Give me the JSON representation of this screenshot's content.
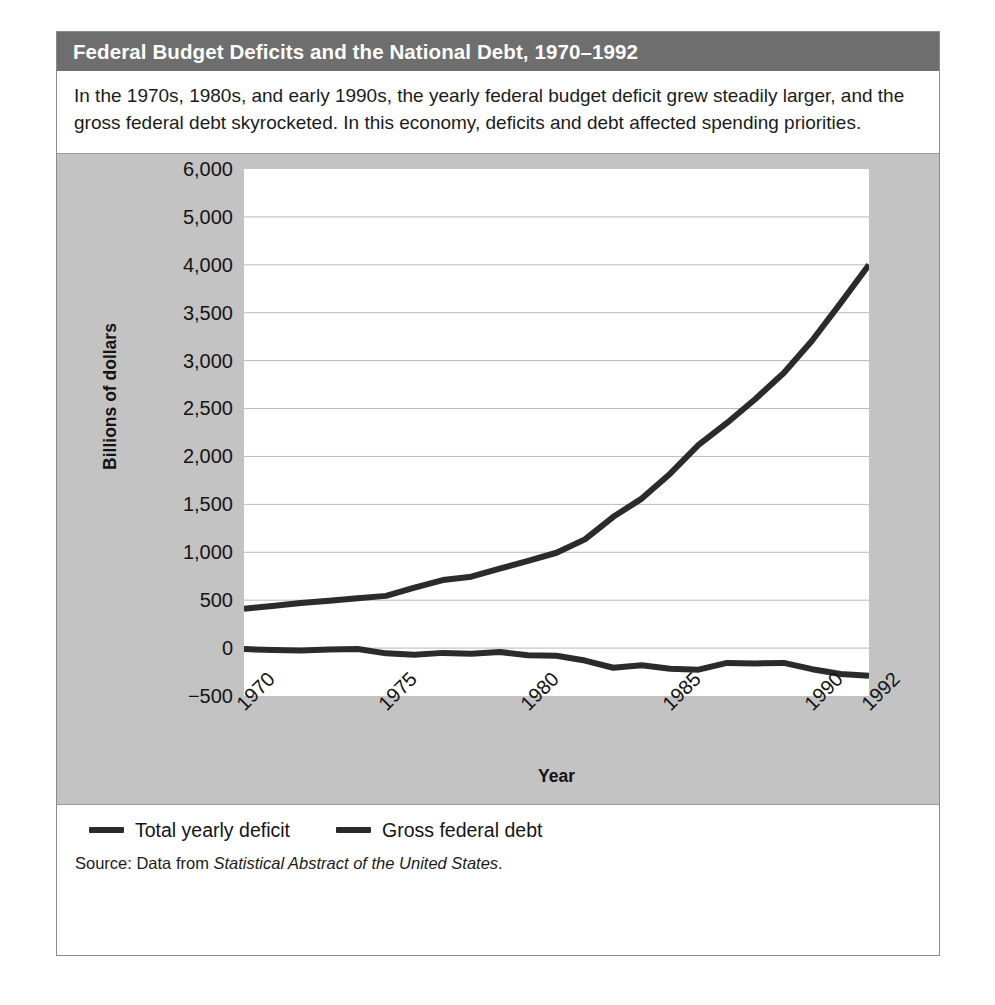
{
  "figure": {
    "title": "Federal Budget Deficits and the National Debt, 1970–1992",
    "caption": "In the 1970s, 1980s, and early 1990s, the yearly federal budget deficit grew steadily larger, and the gross federal debt skyrocketed. In this economy, deficits and debt affected spending priorities.",
    "source_prefix": "Source: Data from ",
    "source_title": "Statistical Abstract of the United States",
    "source_suffix": ".",
    "header_bg": "#6e6e6e",
    "panel_bg": "#c3c3c3",
    "line_color": "#2b2b2b"
  },
  "chart_data": {
    "type": "line",
    "title": "Federal Budget Deficits and the National Debt, 1970–1992",
    "xlabel": "Year",
    "ylabel": "Billions of dollars",
    "grid": true,
    "legend_position": "below",
    "xlim": [
      1970,
      1992
    ],
    "x_tick_labels": [
      "1970",
      "1975",
      "1980",
      "1985",
      "1990",
      "1992"
    ],
    "x_tick_values": [
      1970,
      1975,
      1980,
      1985,
      1990,
      1992
    ],
    "y_tick_labels": [
      "6,000",
      "5,000",
      "4,000",
      "3,500",
      "3,000",
      "2,500",
      "2,000",
      "1,500",
      "1,000",
      "500",
      "0",
      "-500"
    ],
    "y_tick_values": [
      6000,
      5000,
      4000,
      3500,
      3000,
      2500,
      2000,
      1500,
      1000,
      500,
      0,
      -500
    ],
    "x": [
      1970,
      1971,
      1972,
      1973,
      1974,
      1975,
      1976,
      1977,
      1978,
      1979,
      1980,
      1981,
      1982,
      1983,
      1984,
      1985,
      1986,
      1987,
      1988,
      1989,
      1990,
      1991,
      1992
    ],
    "series": [
      {
        "name": "Gross federal debt",
        "values": [
          410,
          440,
          470,
          495,
          520,
          545,
          630,
          710,
          745,
          830,
          910,
          995,
          1135,
          1370,
          1560,
          1820,
          2120,
          2350,
          2600,
          2870,
          3210,
          3600,
          4000
        ]
      },
      {
        "name": "Total yearly deficit",
        "values": [
          -10,
          -20,
          -25,
          -15,
          -10,
          -55,
          -70,
          -50,
          -60,
          -40,
          -75,
          -80,
          -130,
          -205,
          -180,
          -215,
          -225,
          -155,
          -160,
          -155,
          -220,
          -270,
          -290
        ]
      }
    ]
  },
  "legend": {
    "items": [
      {
        "label": "Total yearly deficit"
      },
      {
        "label": "Gross federal debt"
      }
    ]
  }
}
